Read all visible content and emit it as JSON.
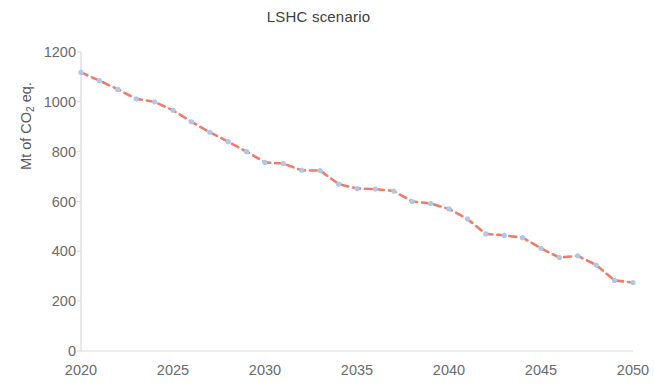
{
  "chart_data": {
    "type": "line",
    "title": "LSHC scenario",
    "xlabel": "",
    "ylabel": "Mt of CO2 eq.",
    "ylabel_prefix": "Mt of CO",
    "ylabel_sub": "2",
    "ylabel_suffix": " eq.",
    "xlim": [
      2020,
      2050
    ],
    "ylim": [
      0,
      1200
    ],
    "x_ticks": [
      2020,
      2025,
      2030,
      2035,
      2040,
      2045,
      2050
    ],
    "y_ticks": [
      0,
      200,
      400,
      600,
      800,
      1000,
      1200
    ],
    "grid": false,
    "legend": "none",
    "series": [
      {
        "name": "LSHC scenario",
        "line_color": "#ED7D6A",
        "marker_color": "#AFC8E8",
        "line_style": "dashed",
        "marker": "circle",
        "x": [
          2020,
          2021,
          2022,
          2023,
          2024,
          2025,
          2026,
          2027,
          2028,
          2029,
          2030,
          2031,
          2032,
          2033,
          2034,
          2035,
          2036,
          2037,
          2038,
          2039,
          2040,
          2041,
          2042,
          2043,
          2044,
          2045,
          2046,
          2047,
          2048,
          2049,
          2050
        ],
        "values": [
          1118,
          1085,
          1050,
          1012,
          1000,
          966,
          920,
          878,
          840,
          800,
          757,
          752,
          725,
          724,
          670,
          652,
          650,
          642,
          600,
          592,
          570,
          530,
          470,
          464,
          455,
          412,
          375,
          382,
          345,
          283,
          275
        ]
      }
    ]
  }
}
